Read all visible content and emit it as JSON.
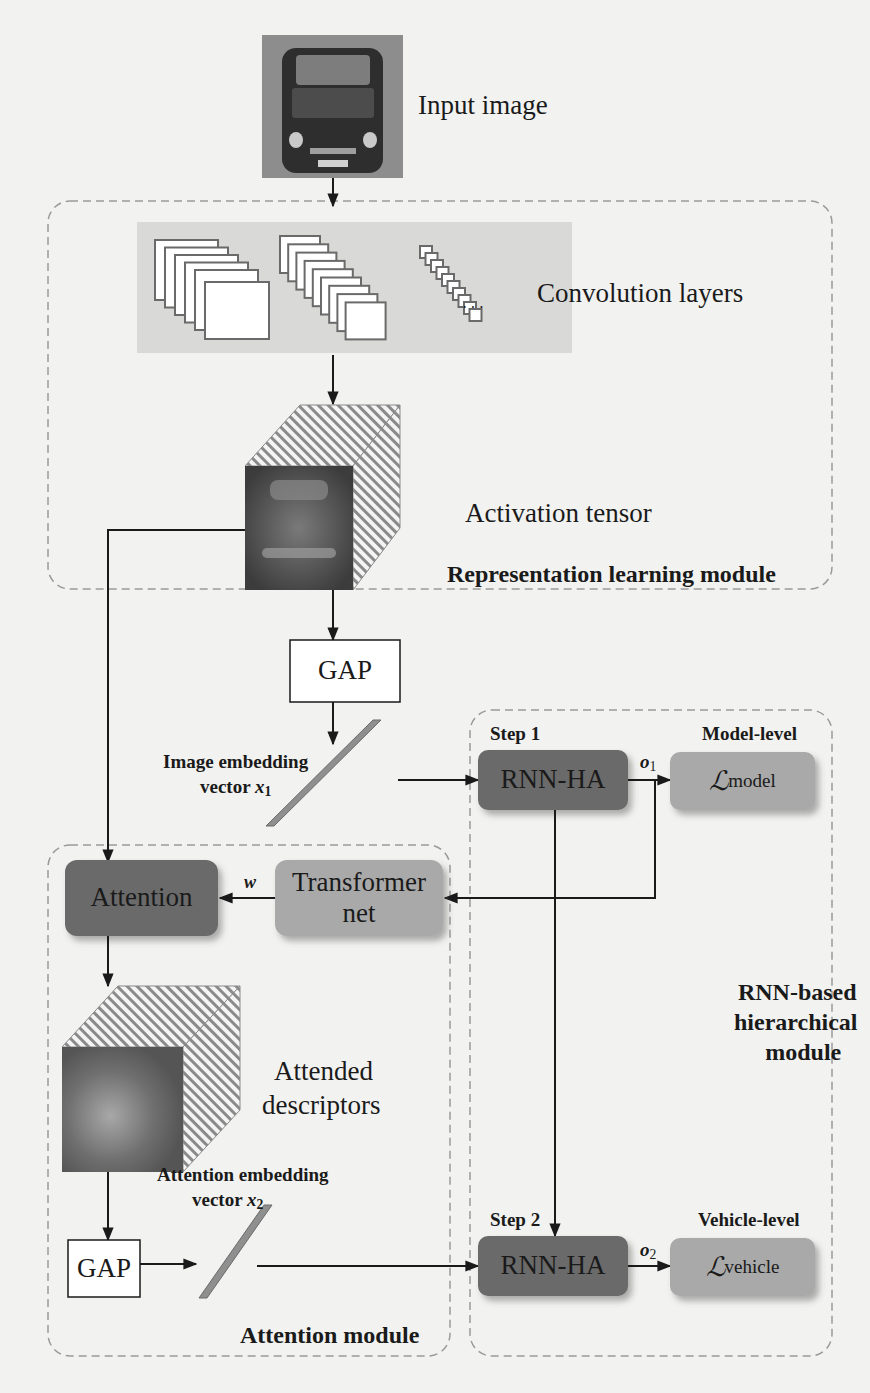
{
  "figure": {
    "input": {
      "label": "Input image"
    },
    "representation_module": {
      "title": "Representation learning module",
      "conv_label": "Convolution layers",
      "ellipsis": "···",
      "activation_label": "Activation tensor"
    },
    "gap_top": {
      "label": "GAP"
    },
    "image_embedding": {
      "line1": "Image embedding",
      "line2_prefix": "vector ",
      "var": "x",
      "sub": "1"
    },
    "rnn_module": {
      "title_line1": "RNN-based",
      "title_line2": "hierarchical",
      "title_line3": "module",
      "step1": {
        "label": "Step 1",
        "box": "RNN-HA",
        "output_var": "o",
        "output_sub": "1",
        "level_label": "Model-level",
        "loss_symbol": "ℒ",
        "loss_sub": "model"
      },
      "step2": {
        "label": "Step 2",
        "box": "RNN-HA",
        "output_var": "o",
        "output_sub": "2",
        "level_label": "Vehicle-level",
        "loss_symbol": "ℒ",
        "loss_sub": "vehicle"
      }
    },
    "attention_module": {
      "title": "Attention module",
      "attention_box": "Attention",
      "transformer_line1": "Transformer",
      "transformer_line2": "net",
      "weight_var": "w",
      "attended_line1": "Attended",
      "attended_line2": "descriptors",
      "gap_label": "GAP",
      "embedding_line1": "Attention embedding",
      "embedding_line2_prefix": "vector ",
      "embedding_var": "x",
      "embedding_sub": "2"
    },
    "colors": {
      "background": "#f2f2f0",
      "conv_region": "#d9d9d7",
      "dark_box": "#6b6b6b",
      "light_box": "#a9a9a9",
      "dash": "#9a9a9a",
      "line": "#1a1a1a"
    }
  }
}
